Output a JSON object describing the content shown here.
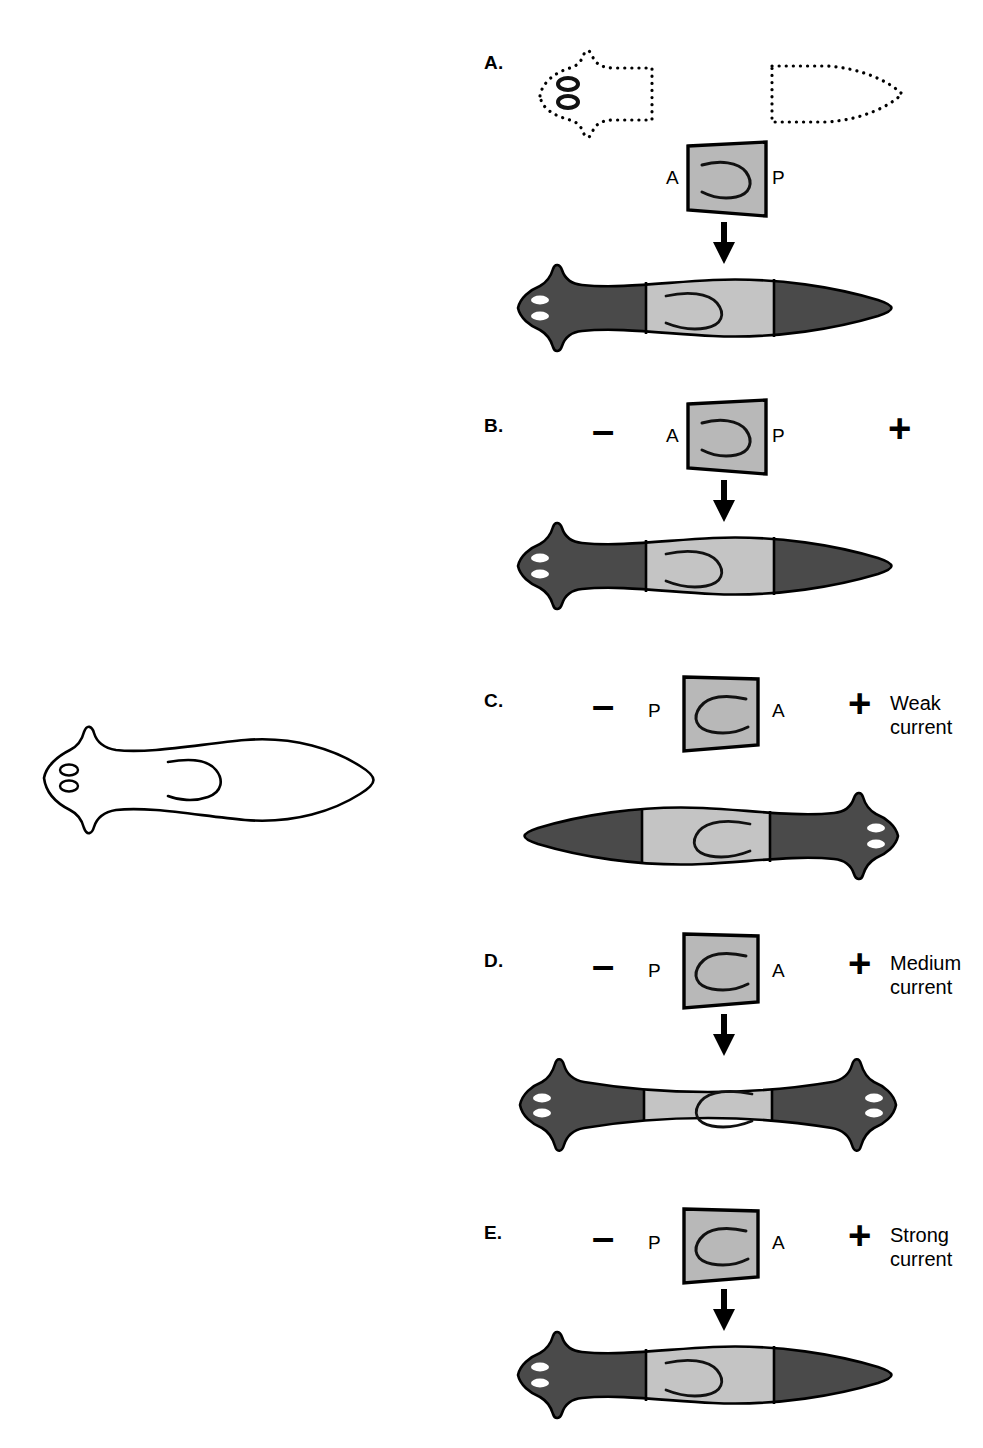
{
  "figure": {
    "title": "",
    "background_color": "#ffffff",
    "organism": "planarian",
    "colors": {
      "host_body": "#4a4a4a",
      "graft_fill": "#b8b8b8",
      "outline": "#000000",
      "eye_fill": "#ffffff",
      "reference_fill": "#ffffff",
      "dotted_outline": "#000000"
    }
  },
  "reference": {
    "name": "intact-planarian-outline",
    "description": "intact worm outline, head left with two eyespots, branched gut"
  },
  "panels": [
    {
      "id": "A",
      "label": "A.",
      "minus": "",
      "plus": "",
      "graft_left_label": "A",
      "graft_right_label": "P",
      "current": "",
      "has_arrow": true,
      "has_dotted_fragments": true,
      "result": "normal-worm-head-left",
      "gut_facing": "left"
    },
    {
      "id": "B",
      "label": "B.",
      "minus": "–",
      "plus": "+",
      "graft_left_label": "A",
      "graft_right_label": "P",
      "current": "",
      "has_arrow": true,
      "has_dotted_fragments": false,
      "result": "normal-worm-head-left",
      "gut_facing": "left"
    },
    {
      "id": "C",
      "label": "C.",
      "minus": "–",
      "plus": "+",
      "graft_left_label": "P",
      "graft_right_label": "A",
      "current": "Weak\ncurrent",
      "current_line1": "Weak",
      "current_line2": "current",
      "has_arrow": false,
      "has_dotted_fragments": false,
      "result": "reversed-worm-head-right",
      "gut_facing": "right"
    },
    {
      "id": "D",
      "label": "D.",
      "minus": "–",
      "plus": "+",
      "graft_left_label": "P",
      "graft_right_label": "A",
      "current": "Medium\ncurrent",
      "current_line1": "Medium",
      "current_line2": "current",
      "has_arrow": true,
      "has_dotted_fragments": false,
      "result": "bipolar-worm-two-heads",
      "gut_facing": "right"
    },
    {
      "id": "E",
      "label": "E.",
      "minus": "–",
      "plus": "+",
      "graft_left_label": "P",
      "graft_right_label": "A",
      "current": "Strong\ncurrent",
      "current_line1": "Strong",
      "current_line2": "current",
      "has_arrow": true,
      "has_dotted_fragments": false,
      "result": "normal-worm-head-left",
      "gut_facing": "left"
    }
  ]
}
